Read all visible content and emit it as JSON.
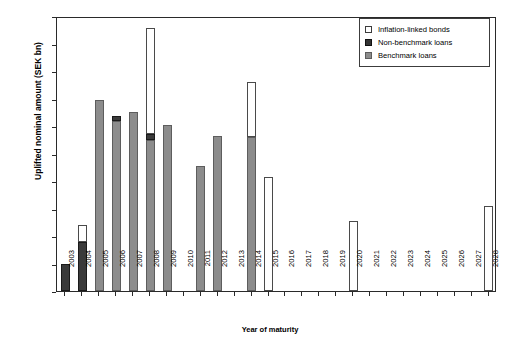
{
  "chart_data": {
    "type": "bar",
    "stacked": true,
    "title": "",
    "xlabel": "Year of maturity",
    "ylabel": "Uplifted nominal amount (SEK bn)",
    "ylim": [
      0,
      100
    ],
    "yticks": [
      0,
      10,
      20,
      30,
      40,
      50,
      60,
      70,
      80,
      90,
      100
    ],
    "grid": false,
    "legend_position": "top-right",
    "categories": [
      "2003",
      "2004",
      "2005",
      "2006",
      "2007",
      "2008",
      "2009",
      "2010",
      "2011",
      "2012",
      "2013",
      "2014",
      "2015",
      "2016",
      "2017",
      "2018",
      "2019",
      "2020",
      "2021",
      "2022",
      "2023",
      "2024",
      "2025",
      "2026",
      "2027",
      "2028"
    ],
    "series": [
      {
        "name": "Benchmark loans",
        "color": "#8c8c8c",
        "values": [
          0,
          0,
          69.5,
          62.0,
          65.0,
          55.0,
          60.3,
          0,
          45.5,
          56.3,
          0,
          56.0,
          0,
          0,
          0,
          0,
          0,
          0,
          0,
          0,
          0,
          0,
          0,
          0,
          0,
          0
        ]
      },
      {
        "name": "Non-benchmark loans",
        "color": "#333333",
        "values": [
          9.8,
          18.0,
          0,
          1.5,
          0,
          2.0,
          0,
          0,
          0,
          0,
          0,
          0,
          0,
          0,
          0,
          0,
          0,
          0,
          0,
          0,
          0,
          0,
          0,
          0,
          0,
          0
        ]
      },
      {
        "name": "Inflation-linked bonds",
        "color": "#ffffff",
        "values": [
          0,
          6.0,
          0,
          0,
          0,
          38.5,
          0,
          0,
          0,
          0,
          0,
          20.0,
          41.3,
          0,
          0,
          0,
          0,
          25.5,
          0,
          0,
          0,
          0,
          0,
          0,
          0,
          31.0
        ]
      }
    ],
    "totals": [
      9.8,
      24.0,
      69.5,
      63.5,
      65.0,
      95.5,
      60.3,
      0,
      45.5,
      56.3,
      0,
      76.0,
      41.3,
      0,
      0,
      0,
      0,
      25.5,
      0,
      0,
      0,
      0,
      0,
      0,
      0,
      31.0
    ]
  },
  "legend": {
    "items": [
      {
        "label": "Inflation-linked bonds",
        "swatch": "open-square-white"
      },
      {
        "label": "Non-benchmark loans",
        "swatch": "filled-square-black"
      },
      {
        "label": "Benchmark loans",
        "swatch": "filled-square-gray"
      }
    ]
  }
}
